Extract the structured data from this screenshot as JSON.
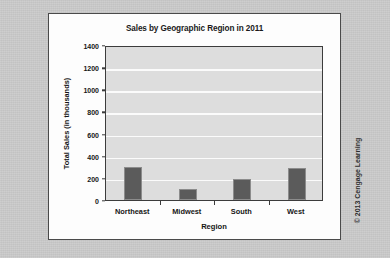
{
  "figure": {
    "credit": "© 2013 Cengage Learning"
  },
  "chart_data": {
    "type": "bar",
    "title": "Sales by Geographic Region in 2011",
    "xlabel": "Region",
    "ylabel": "Total Sales (in thousands)",
    "categories": [
      "Northeast",
      "Midwest",
      "South",
      "West"
    ],
    "values": [
      300,
      100,
      190,
      285
    ],
    "ylim": [
      0,
      1400
    ],
    "ytick_step": 200,
    "yticks": [
      0,
      200,
      400,
      600,
      800,
      1000,
      1200,
      1400
    ],
    "ytick_labels": [
      "0",
      "200",
      "400",
      "600",
      "800",
      "1000",
      "1200",
      "1400"
    ],
    "grid": true,
    "legend": false,
    "bar_color": "#5b5b5b",
    "plot_bg": "#dddddd",
    "gridline_color": "#fbfbfb"
  }
}
